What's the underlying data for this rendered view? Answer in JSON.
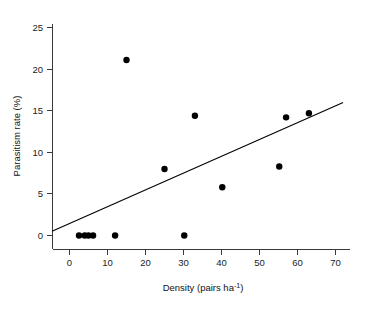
{
  "chart_data": {
    "type": "scatter",
    "title": "",
    "xlabel": "Density (pairs ha-1)",
    "xlabel_base": "Density (pairs ha",
    "xlabel_sup": "-1",
    "xlabel_tail": ")",
    "ylabel": "Parasitism rate (%)",
    "xlim": [
      -5,
      74
    ],
    "ylim": [
      -1.5,
      26.5
    ],
    "xticks": [
      0,
      10,
      20,
      30,
      40,
      50,
      60,
      70
    ],
    "xtick_labels": [
      "0",
      "10",
      "20",
      "30",
      "40",
      "50",
      "60",
      "70"
    ],
    "yticks": [
      0,
      5,
      10,
      15,
      20,
      25
    ],
    "ytick_labels": [
      "0",
      "5",
      "10",
      "15",
      "20",
      "25"
    ],
    "grid": false,
    "legend": null,
    "marker": "filled-circle",
    "marker_color": "#000000",
    "point_radius_px": 3.2,
    "x": [
      2.5,
      4.0,
      5.0,
      6.2,
      12.0,
      15.0,
      25.0,
      30.2,
      33.0,
      40.2,
      55.2,
      57.0,
      63.0
    ],
    "y": [
      0.0,
      0.0,
      0.0,
      0.0,
      0.0,
      21.1,
      8.0,
      0.0,
      14.4,
      5.8,
      8.3,
      14.2,
      14.7
    ],
    "points": [
      {
        "x": 2.5,
        "y": 0.0
      },
      {
        "x": 4.0,
        "y": 0.0
      },
      {
        "x": 5.0,
        "y": 0.0
      },
      {
        "x": 6.2,
        "y": 0.0
      },
      {
        "x": 12.0,
        "y": 0.0
      },
      {
        "x": 15.0,
        "y": 21.1
      },
      {
        "x": 25.0,
        "y": 8.0
      },
      {
        "x": 30.2,
        "y": 0.0
      },
      {
        "x": 33.0,
        "y": 14.4
      },
      {
        "x": 40.2,
        "y": 5.8
      },
      {
        "x": 55.2,
        "y": 8.3
      },
      {
        "x": 57.0,
        "y": 14.2
      },
      {
        "x": 63.0,
        "y": 14.7
      }
    ],
    "fit_line": {
      "type": "linear-regression",
      "color": "#000000",
      "x_start": -4.6,
      "y_start": 0.5,
      "x_end": 72.0,
      "y_end": 16.0
    }
  }
}
